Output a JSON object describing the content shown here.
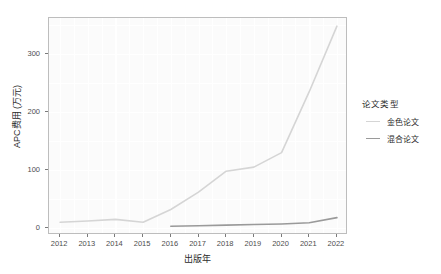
{
  "chart_data": {
    "type": "line",
    "title": "",
    "xlabel": "出版年",
    "ylabel": "APC费用 (万元)",
    "x": [
      2012,
      2013,
      2014,
      2015,
      2016,
      2017,
      2018,
      2019,
      2020,
      2021,
      2022
    ],
    "xlim": [
      2011.6,
      2022.4
    ],
    "ylim": [
      -12,
      362
    ],
    "yticks": [
      0,
      100,
      200,
      300
    ],
    "ytick_labels": [
      "0",
      "100",
      "200",
      "300"
    ],
    "xticks": [
      2012,
      2013,
      2014,
      2015,
      2016,
      2017,
      2018,
      2019,
      2020,
      2021,
      2022
    ],
    "xtick_labels": [
      "2012",
      "2013",
      "2014",
      "2015",
      "2016",
      "2017",
      "2018",
      "2019",
      "2020",
      "2021",
      "2022"
    ],
    "grid": true,
    "grid_color": "#ffffff",
    "panel_background": "#fbfbfb",
    "legend_position": "right",
    "legend_title": "论文类型",
    "series": [
      {
        "name": "金色论文",
        "color": "#d5d5d5",
        "x": [
          2012,
          2013,
          2014,
          2015,
          2016,
          2017,
          2018,
          2019,
          2020,
          2021,
          2022
        ],
        "values": [
          10,
          12,
          15,
          10,
          32,
          62,
          98,
          105,
          130,
          235,
          348
        ]
      },
      {
        "name": "混合论文",
        "color": "#9a9a9a",
        "x": [
          2016,
          2017,
          2018,
          2019,
          2020,
          2021,
          2022
        ],
        "values": [
          3,
          4,
          5,
          6,
          7,
          9,
          18
        ]
      }
    ]
  },
  "legend": {
    "title": "论文类型",
    "items": [
      {
        "label": "金色论文",
        "color": "#d5d5d5"
      },
      {
        "label": "混合论文",
        "color": "#9a9a9a"
      }
    ]
  },
  "axes": {
    "x_title": "出版年",
    "y_title": "APC费用 (万元)"
  }
}
